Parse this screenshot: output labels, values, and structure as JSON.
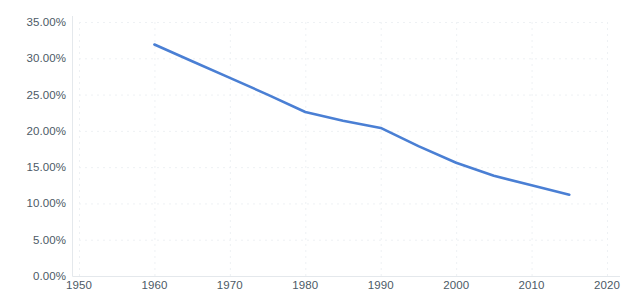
{
  "chart_data": {
    "type": "line",
    "title": "",
    "subtitle": "",
    "xlabel": "",
    "ylabel": "",
    "xlim": [
      1950,
      2020
    ],
    "ylim": [
      0,
      35
    ],
    "grid": true,
    "legend": null,
    "legend_position": "none",
    "y_tick_labels": [
      "35.00%",
      "30.00%",
      "25.00%",
      "20.00%",
      "15.00%",
      "10.00%",
      "5.00%",
      "0.00%"
    ],
    "y_tick_values": [
      35,
      30,
      25,
      20,
      15,
      10,
      5,
      0
    ],
    "x_tick_labels": [
      "1950",
      "1960",
      "1970",
      "1980",
      "1990",
      "2000",
      "2010",
      "2020"
    ],
    "x_tick_values": [
      1950,
      1960,
      1970,
      1980,
      1990,
      2000,
      2010,
      2020
    ],
    "series": [
      {
        "name": "",
        "color": "#4a7fd4",
        "line_width": 2.6,
        "x": [
          1960,
          1965,
          1970,
          1975,
          1980,
          1985,
          1990,
          1995,
          2000,
          2005,
          2010,
          2015
        ],
        "values": [
          31.9,
          29.6,
          27.3,
          25.0,
          22.6,
          21.4,
          20.4,
          17.9,
          15.6,
          13.8,
          12.5,
          11.2
        ]
      }
    ],
    "colors": {
      "line": "#4a7fd4",
      "axis_text": "#4c5a66",
      "gridline": "#eef1f4",
      "axis_line": "#e4e8ec",
      "background": "#ffffff"
    }
  }
}
